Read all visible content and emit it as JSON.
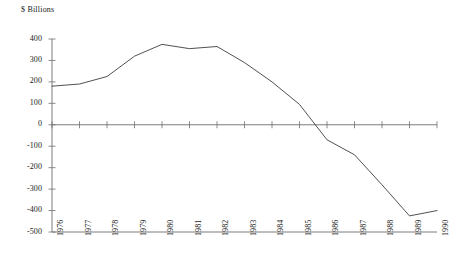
{
  "chart_data": {
    "type": "line",
    "title": "",
    "subtitle": "",
    "xlabel": "",
    "ylabel": "$ Billions",
    "ylim": [
      -500,
      400
    ],
    "ytick_values": [
      400,
      300,
      200,
      100,
      0,
      -100,
      -200,
      -300,
      -400,
      -500
    ],
    "ytick_labels": [
      "400",
      "300",
      "200",
      "100",
      "0",
      "-100",
      "-200",
      "-300",
      "-400",
      "-500"
    ],
    "grid": false,
    "legend": false,
    "legend_position": "none",
    "categories": [
      "1976",
      "1977",
      "1978",
      "1979",
      "1980",
      "1981",
      "1982",
      "1983",
      "1984",
      "1985",
      "1986",
      "1987",
      "1988",
      "1989",
      "1990"
    ],
    "x": [
      1976,
      1977,
      1978,
      1979,
      1980,
      1981,
      1982,
      1983,
      1984,
      1985,
      1986,
      1987,
      1988,
      1989,
      1990
    ],
    "values": [
      180,
      190,
      225,
      320,
      375,
      355,
      365,
      290,
      200,
      95,
      -70,
      -140,
      -280,
      -425,
      -400
    ],
    "series": [
      {
        "name": "",
        "values": [
          180,
          190,
          225,
          320,
          375,
          355,
          365,
          290,
          200,
          95,
          -70,
          -140,
          -280,
          -425,
          -400
        ]
      }
    ],
    "line_color": "#3d3d3d",
    "axis_color": "#6e6e6e",
    "background_color": "#ffffff",
    "zero_line": 0,
    "xtick_rotation": -90
  }
}
